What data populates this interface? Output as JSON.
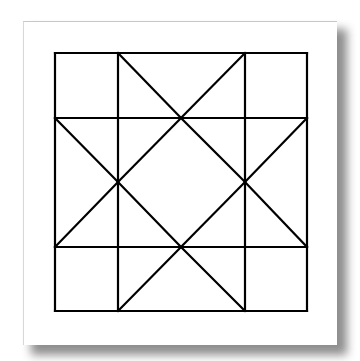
{
  "figure": {
    "stroke_color": "#000000",
    "stroke_width": 2.2,
    "paper_color": "#ffffff",
    "shadow_color": "#7a7a7a",
    "grid": {
      "x": [
        55,
        118,
        245,
        307
      ],
      "y": [
        53,
        118,
        247,
        311
      ]
    },
    "lines": [
      [
        55,
        53,
        307,
        53
      ],
      [
        55,
        118,
        307,
        118
      ],
      [
        55,
        247,
        307,
        247
      ],
      [
        55,
        311,
        307,
        311
      ],
      [
        55,
        53,
        55,
        311
      ],
      [
        118,
        53,
        118,
        311
      ],
      [
        245,
        53,
        245,
        311
      ],
      [
        307,
        53,
        307,
        311
      ],
      [
        118,
        53,
        181,
        118
      ],
      [
        245,
        53,
        181,
        118
      ],
      [
        118,
        311,
        181,
        247
      ],
      [
        245,
        311,
        181,
        247
      ],
      [
        55,
        118,
        118,
        182
      ],
      [
        55,
        247,
        118,
        182
      ],
      [
        307,
        118,
        245,
        182
      ],
      [
        307,
        247,
        245,
        182
      ],
      [
        181,
        118,
        245,
        182
      ],
      [
        245,
        182,
        181,
        247
      ],
      [
        181,
        247,
        118,
        182
      ],
      [
        118,
        182,
        181,
        118
      ]
    ]
  }
}
